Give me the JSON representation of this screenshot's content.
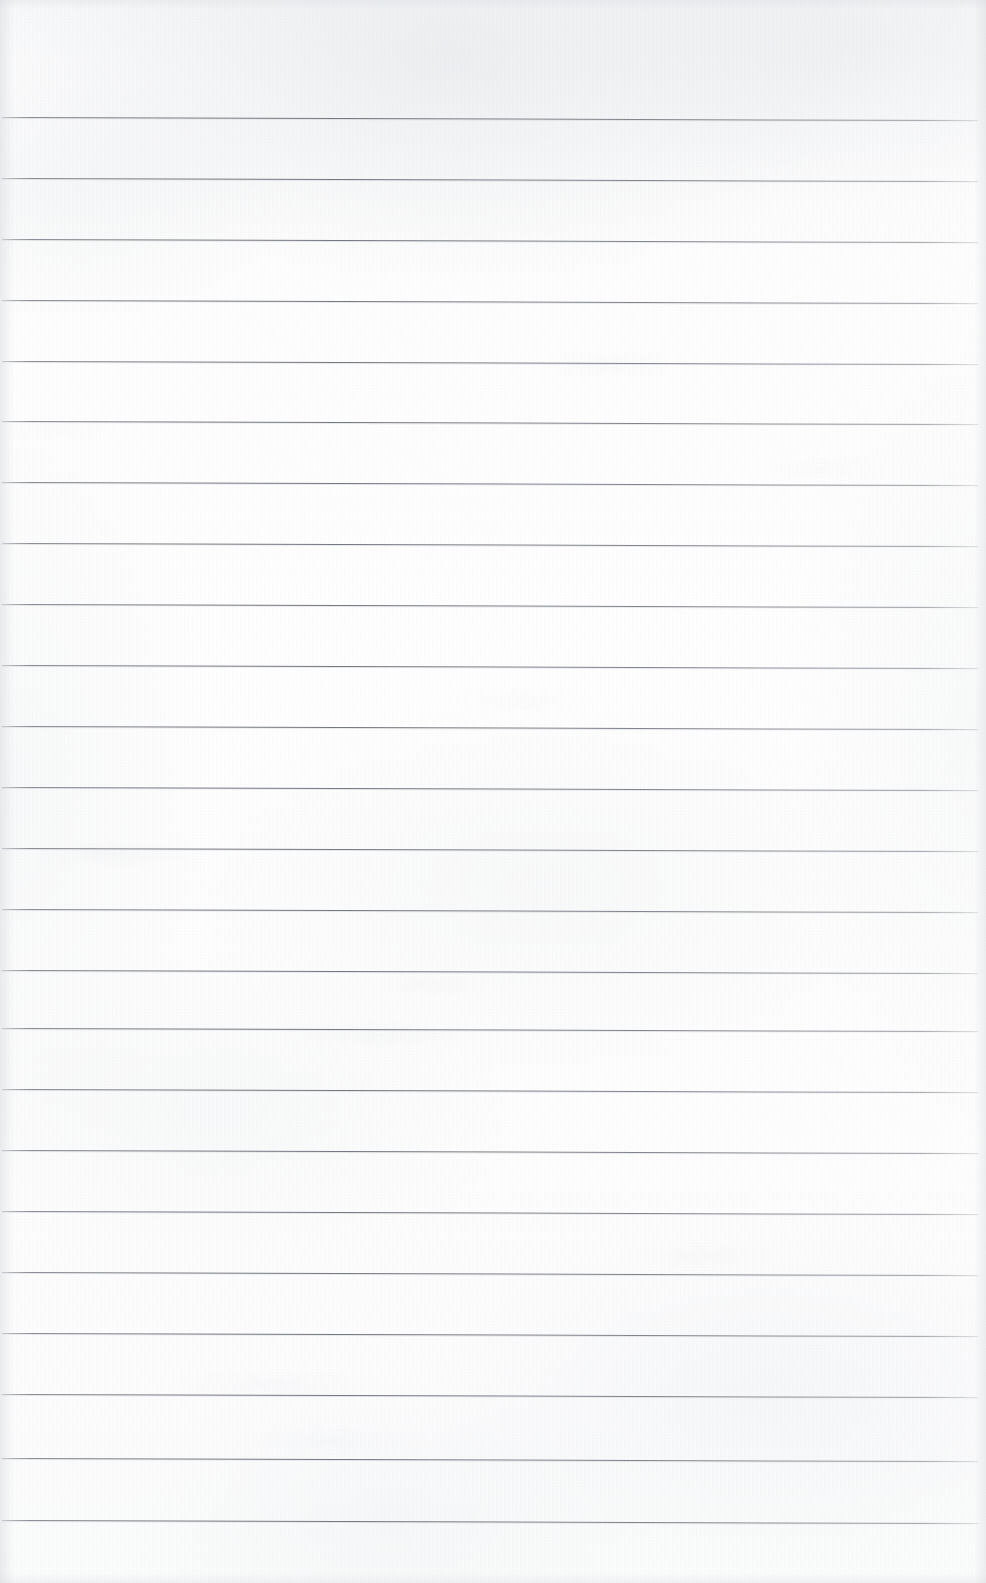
{
  "document": {
    "kind": "scanned-ruled-notebook-page",
    "title": "Blank Ruled Page",
    "page_width": 986,
    "page_height": 1583,
    "orientation": "portrait",
    "content_text": "",
    "has_handwriting": false,
    "has_printed_text": false,
    "has_margin_line": false,
    "has_header": false,
    "has_page_number": false
  },
  "paper": {
    "background_color": "#fdfdfd",
    "tint_color": "#f7f8f9",
    "texture": "scanner-grain",
    "top_margin_px": 117,
    "bottom_margin_px": 63
  },
  "ruling": {
    "line_color": "#787c83",
    "line_thickness_px": 1,
    "line_spacing_px": 60.9,
    "first_line_y": 117,
    "last_line_y": 1520,
    "line_start_x": 2,
    "line_end_x": 978,
    "line_count": 24,
    "slant_deg": 0.18,
    "lines_y": [
      117,
      178,
      239,
      300,
      361,
      421,
      482,
      543,
      604,
      665,
      726,
      787,
      848,
      909,
      970,
      1028,
      1089,
      1150,
      1211,
      1272,
      1333,
      1394,
      1458,
      1520
    ]
  },
  "smudges": [
    {
      "x": 120,
      "y": 855,
      "w": 180,
      "h": 28,
      "opacity": 0.28
    },
    {
      "x": 380,
      "y": 1035,
      "w": 210,
      "h": 26,
      "opacity": 0.26
    },
    {
      "x": 610,
      "y": 365,
      "w": 150,
      "h": 30,
      "opacity": 0.2
    },
    {
      "x": 275,
      "y": 1385,
      "w": 230,
      "h": 34,
      "opacity": 0.24
    },
    {
      "x": 700,
      "y": 1255,
      "w": 170,
      "h": 28,
      "opacity": 0.2
    },
    {
      "x": 430,
      "y": 985,
      "w": 120,
      "h": 22,
      "opacity": 0.22
    },
    {
      "x": 820,
      "y": 470,
      "w": 140,
      "h": 26,
      "opacity": 0.18
    },
    {
      "x": 60,
      "y": 430,
      "w": 130,
      "h": 24,
      "opacity": 0.16
    },
    {
      "x": 520,
      "y": 700,
      "w": 160,
      "h": 30,
      "opacity": 0.16
    },
    {
      "x": 330,
      "y": 1440,
      "w": 190,
      "h": 26,
      "opacity": 0.2
    }
  ]
}
